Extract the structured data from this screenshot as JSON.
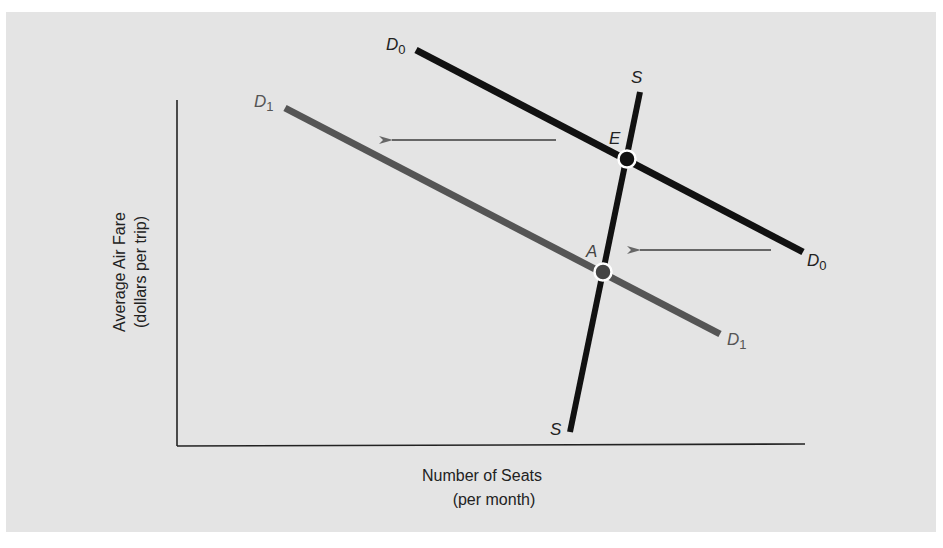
{
  "diagram": {
    "type": "supply-demand",
    "background_color": "#e4e4e4",
    "axes": {
      "x_label_line1": "Number of Seats",
      "x_label_line2": "(per month)",
      "y_label_line1": "Average Air Fare",
      "y_label_line2": "(dollars per trip)"
    },
    "curves": {
      "demand_original": {
        "label": "D",
        "subscript": "0",
        "color": "#111111"
      },
      "demand_new": {
        "label": "D",
        "subscript": "1",
        "color": "#555555"
      },
      "supply": {
        "label": "S",
        "color": "#111111"
      }
    },
    "points": {
      "original_equilibrium": {
        "label": "E",
        "color": "#111111"
      },
      "new_equilibrium": {
        "label": "A",
        "color": "#444444"
      }
    },
    "shift_arrows": {
      "direction": "left",
      "color": "#666666",
      "count": 2
    }
  }
}
